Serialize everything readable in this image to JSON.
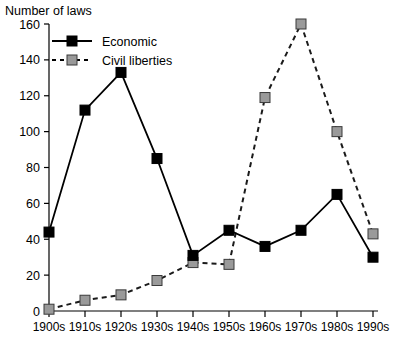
{
  "chart_data": {
    "type": "line",
    "title": "Number of laws",
    "xlabel": "",
    "ylabel": "Number of laws",
    "categories": [
      "1900s",
      "1910s",
      "1920s",
      "1930s",
      "1940s",
      "1950s",
      "1960s",
      "1970s",
      "1980s",
      "1990s"
    ],
    "series": [
      {
        "name": "Economic",
        "values": [
          44,
          112,
          133,
          85,
          31,
          45,
          36,
          45,
          65,
          30
        ],
        "color": "#000000",
        "marker": "filled-square",
        "linestyle": "solid"
      },
      {
        "name": "Civil liberties",
        "values": [
          1,
          6,
          9,
          17,
          27,
          26,
          119,
          160,
          100,
          43
        ],
        "color": "#9a9a9a",
        "marker": "gray-square",
        "linestyle": "dashed"
      }
    ],
    "ylim": [
      0,
      160
    ],
    "yticks": [
      0,
      20,
      40,
      60,
      80,
      100,
      120,
      140,
      160
    ],
    "ytick_labels": [
      "0",
      "20",
      "40",
      "60",
      "80",
      "100",
      "120",
      "140",
      "160"
    ],
    "grid": false,
    "legend_position": "top-left"
  },
  "legend": {
    "items": [
      {
        "label": "Economic"
      },
      {
        "label": "Civil liberties"
      }
    ]
  }
}
